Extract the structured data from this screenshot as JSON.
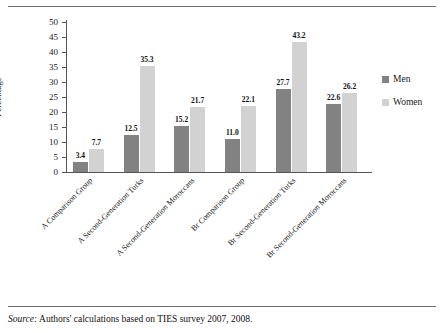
{
  "chart_data": {
    "type": "bar",
    "title": "",
    "xlabel": "",
    "ylabel": "Percentage",
    "ylim": [
      0,
      50
    ],
    "yticks": [
      0,
      5,
      10,
      15,
      20,
      25,
      30,
      35,
      40,
      45,
      50
    ],
    "grid": false,
    "legend_position": "right",
    "categories": [
      "A Comparison Group",
      "A Second-Generation Turks",
      "A Second-Generation Moroccans",
      "Br Comparison Group",
      "Br Second-Generation Turks",
      "Br Second-Generation Moroccans"
    ],
    "series": [
      {
        "name": "Men",
        "color": "#828282",
        "values": [
          3.4,
          12.5,
          15.2,
          11.0,
          27.7,
          22.6
        ],
        "labels": [
          "3.4",
          "12.5",
          "15.2",
          "11.0",
          "27.7",
          "22.6"
        ]
      },
      {
        "name": "Women",
        "color": "#d2d2d2",
        "values": [
          7.7,
          35.3,
          21.7,
          22.1,
          43.2,
          26.2
        ],
        "labels": [
          "7.7",
          "35.3",
          "21.7",
          "22.1",
          "43.2",
          "26.2"
        ]
      }
    ]
  },
  "axis": {
    "y_title": "Percentage",
    "y_tick_labels": [
      "50",
      "45",
      "40",
      "35",
      "30",
      "25",
      "20",
      "15",
      "10",
      "5",
      "0"
    ]
  },
  "legend": {
    "entries": [
      {
        "label": "Men",
        "swatch": "men"
      },
      {
        "label": "Women",
        "swatch": "women"
      }
    ]
  },
  "footer": {
    "source_word": "Source:",
    "source_text": " Authors' calculations based on TIES survey 2007, 2008."
  }
}
